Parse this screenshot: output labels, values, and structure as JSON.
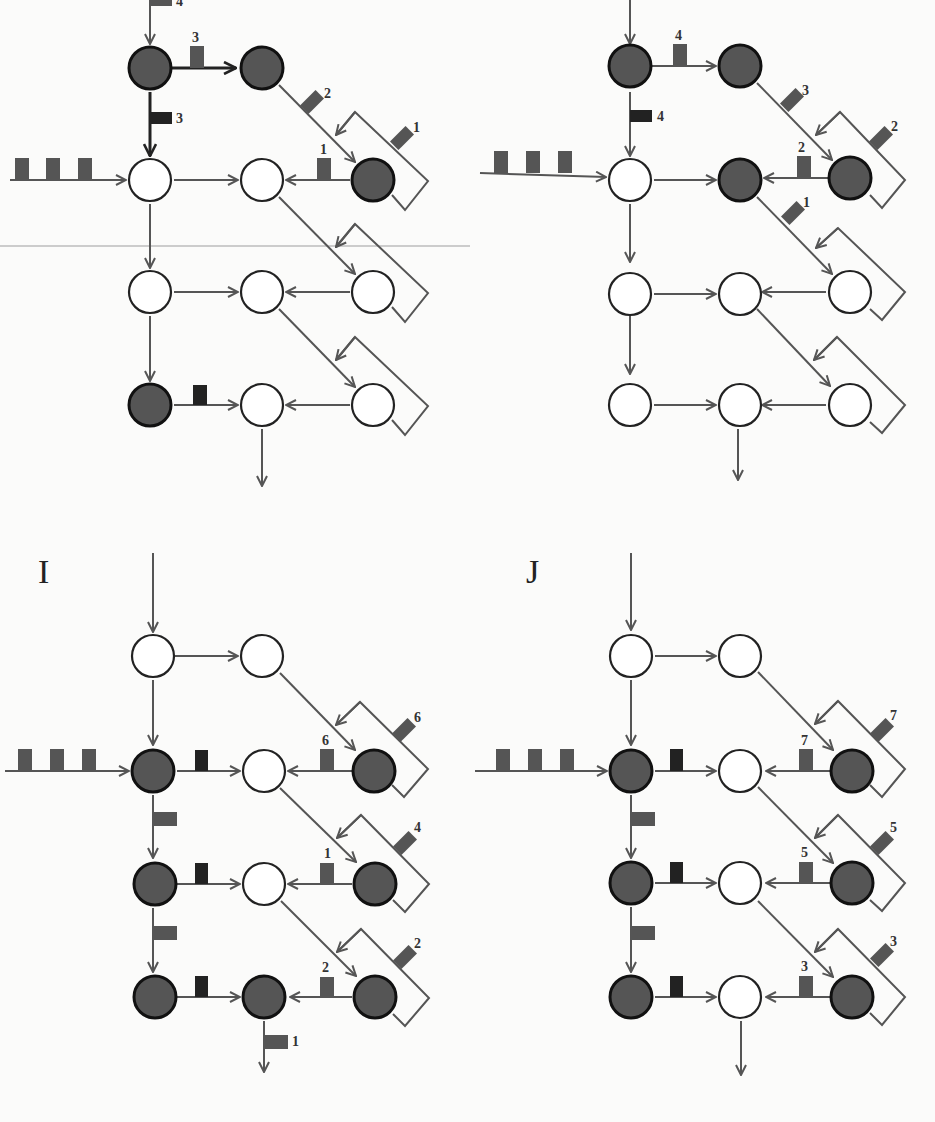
{
  "figure": {
    "panels": [
      {
        "id": "H",
        "label": "",
        "position": "top-left",
        "input_tokens": 3,
        "top_arrow_token_label": "4",
        "edge_labels": {
          "row0_h": "3",
          "row0_down": "3",
          "diag_0": "2",
          "loop_0": "1",
          "row1_back": "1"
        },
        "filled_nodes": [
          "r0c0",
          "r0c1",
          "r1c2",
          "r3c0"
        ]
      },
      {
        "id": "H2",
        "label": "",
        "position": "top-right",
        "input_tokens": 3,
        "edge_labels": {
          "row0_h": "4",
          "row0_down": "4",
          "diag_0": "3",
          "loop_0": "2",
          "row1_back": "2",
          "diag_1": "1"
        },
        "filled_nodes": [
          "r0c0",
          "r0c1",
          "r1c1",
          "r1c2"
        ]
      },
      {
        "id": "I",
        "label": "I",
        "position": "bottom-left",
        "input_tokens": 3,
        "edge_labels": {
          "loop_1": "6",
          "row1_back": "6",
          "loop_2": "4",
          "row2_back": "1",
          "loop_3": "2",
          "row3_back": "2",
          "output": "1"
        },
        "filled_nodes": [
          "r1c0",
          "r1c2",
          "r2c0",
          "r2c2",
          "r3c0",
          "r3c1",
          "r3c2"
        ]
      },
      {
        "id": "J",
        "label": "J",
        "position": "bottom-right",
        "input_tokens": 3,
        "edge_labels": {
          "loop_1": "7",
          "row1_back": "7",
          "loop_2": "5",
          "row2_back": "5",
          "loop_3": "3",
          "row3_back": "3"
        },
        "filled_nodes": [
          "r1c0",
          "r1c2",
          "r2c0",
          "r2c2",
          "r3c0",
          "r3c2"
        ]
      }
    ]
  }
}
